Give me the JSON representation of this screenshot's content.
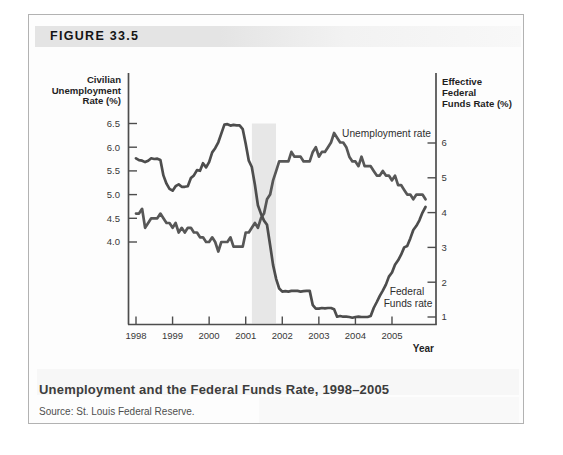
{
  "figure_label": "FIGURE 33.5",
  "caption": {
    "title": "Unemployment and the Federal Funds Rate, 1998–2005",
    "source": "Source: St. Louis Federal Reserve."
  },
  "chart_data": {
    "type": "line",
    "title": "Unemployment and the Federal Funds Rate, 1998–2005",
    "x_axis": {
      "label": "Year",
      "ticks": [
        "1998",
        "1999",
        "2000",
        "2001",
        "2002",
        "2003",
        "2004",
        "2005"
      ],
      "tick_values": [
        1998,
        1999,
        2000,
        2001,
        2002,
        2003,
        2004,
        2005
      ],
      "range": [
        1997.8,
        2006.2
      ]
    },
    "left_axis": {
      "title_lines": [
        "Civilian",
        "Unemployment",
        "Rate (%)"
      ],
      "ticks": [
        "6.5",
        "6.0",
        "5.5",
        "5.0",
        "4.5",
        "4.0"
      ],
      "tick_values": [
        6.5,
        6.0,
        5.5,
        5.0,
        4.5,
        4.0
      ],
      "range": [
        3.6,
        6.9
      ]
    },
    "right_axis": {
      "title_lines": [
        "Effective",
        "Federal",
        "Funds Rate (%)"
      ],
      "ticks": [
        "6",
        "5",
        "4",
        "3",
        "2",
        "1"
      ],
      "tick_values": [
        6,
        5,
        4,
        3,
        2,
        1
      ],
      "range": [
        0.8,
        7.1
      ]
    },
    "grid": false,
    "legend": "in-plot text labels",
    "recession_band": {
      "start_year": 2001.17,
      "end_year": 2001.83,
      "top_value_left_axis": 6.5,
      "color": "#e7e7e7"
    },
    "series": [
      {
        "name": "Unemployment rate",
        "axis": "left",
        "unit": "percent",
        "interval": "monthly",
        "start_year": 1998,
        "color": "#575757",
        "values": [
          4.6,
          4.6,
          4.7,
          4.3,
          4.4,
          4.5,
          4.5,
          4.5,
          4.6,
          4.5,
          4.4,
          4.4,
          4.3,
          4.4,
          4.2,
          4.3,
          4.2,
          4.3,
          4.3,
          4.2,
          4.2,
          4.1,
          4.1,
          4.0,
          4.0,
          4.1,
          4.0,
          3.8,
          4.0,
          4.0,
          4.0,
          4.1,
          3.9,
          3.9,
          3.9,
          3.9,
          4.2,
          4.2,
          4.3,
          4.4,
          4.3,
          4.5,
          4.6,
          4.9,
          5.0,
          5.3,
          5.5,
          5.7,
          5.7,
          5.7,
          5.7,
          5.9,
          5.8,
          5.8,
          5.8,
          5.7,
          5.7,
          5.7,
          5.9,
          6.0,
          5.8,
          5.9,
          5.9,
          6.0,
          6.1,
          6.3,
          6.2,
          6.1,
          6.1,
          6.0,
          5.8,
          5.7,
          5.7,
          5.6,
          5.8,
          5.6,
          5.6,
          5.6,
          5.5,
          5.4,
          5.4,
          5.5,
          5.4,
          5.4,
          5.3,
          5.4,
          5.2,
          5.2,
          5.1,
          5.0,
          5.0,
          4.9,
          5.0,
          5.0,
          5.0,
          4.9
        ]
      },
      {
        "name": "Federal Funds rate",
        "label_lines": [
          "Federal",
          "Funds rate"
        ],
        "axis": "right",
        "unit": "percent",
        "interval": "monthly",
        "start_year": 1998,
        "color": "#4d4d4d",
        "values": [
          5.56,
          5.51,
          5.49,
          5.45,
          5.49,
          5.56,
          5.54,
          5.55,
          5.51,
          5.07,
          4.83,
          4.68,
          4.63,
          4.76,
          4.81,
          4.74,
          4.74,
          4.76,
          4.99,
          5.07,
          5.22,
          5.2,
          5.42,
          5.3,
          5.45,
          5.73,
          5.85,
          6.02,
          6.27,
          6.53,
          6.54,
          6.5,
          6.52,
          6.51,
          6.51,
          6.4,
          5.98,
          5.49,
          5.31,
          4.8,
          4.21,
          3.97,
          3.77,
          3.65,
          3.07,
          2.49,
          2.09,
          1.82,
          1.73,
          1.74,
          1.73,
          1.75,
          1.75,
          1.75,
          1.73,
          1.74,
          1.75,
          1.75,
          1.34,
          1.24,
          1.24,
          1.26,
          1.25,
          1.26,
          1.26,
          1.22,
          1.01,
          1.03,
          1.01,
          1.01,
          1.0,
          0.98,
          1.0,
          1.01,
          1.0,
          1.0,
          1.0,
          1.03,
          1.26,
          1.43,
          1.61,
          1.76,
          1.93,
          2.16,
          2.28,
          2.5,
          2.63,
          2.79,
          3.0,
          3.04,
          3.26,
          3.5,
          3.62,
          3.78,
          4.0,
          4.16
        ]
      }
    ]
  }
}
